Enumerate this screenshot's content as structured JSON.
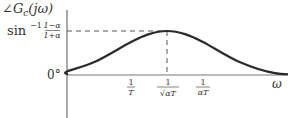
{
  "chart_data": {
    "type": "line",
    "title": "",
    "ylabel": "∠G_c(jω)",
    "xlabel": "ω",
    "y_ticks": [
      {
        "label": "0°",
        "value": 0
      },
      {
        "label": "sin⁻¹ (1−α)/(1+α)",
        "value": 1
      }
    ],
    "x_ticks": [
      {
        "label": "1/T",
        "value": 0
      },
      {
        "label": "1/(√α T)",
        "value": 0.5
      },
      {
        "label": "1/(α T)",
        "value": 1
      }
    ],
    "x_scale": "log",
    "series": [
      {
        "name": "phase",
        "description": "bell-shaped phase lead curve, peaking at ω = 1/(√α T)",
        "x": [
          -2.2,
          -1.5,
          -1.0,
          -0.5,
          0.0,
          0.25,
          0.5,
          0.75,
          1.0,
          1.5,
          2.0,
          2.6
        ],
        "y": [
          0.0,
          0.02,
          0.08,
          0.3,
          0.75,
          0.93,
          1.0,
          0.93,
          0.75,
          0.3,
          0.04,
          0.0
        ]
      }
    ],
    "annotations": [
      {
        "type": "dashed-hline",
        "y": 1,
        "from_x": "axis",
        "to_x": 0.5
      },
      {
        "type": "dashed-vline",
        "x": 0.5,
        "from_y": 1,
        "to_y": 0
      }
    ],
    "grid": false,
    "legend": "none"
  },
  "labels": {
    "ylabel_angle": "∠",
    "ylabel_G": "G",
    "ylabel_sub": "c",
    "ylabel_arg": "(jω)",
    "ymax_sin": "sin",
    "ymax_exp": "−1",
    "ymax_num": "1−α",
    "ymax_den": "1+α",
    "yzero": "0°",
    "xt1_num": "1",
    "xt1_den": "T",
    "xt2_num": "1",
    "xt2_den": "√αT",
    "xt3_num": "1",
    "xt3_den": "αT",
    "xlabel": "ω"
  }
}
